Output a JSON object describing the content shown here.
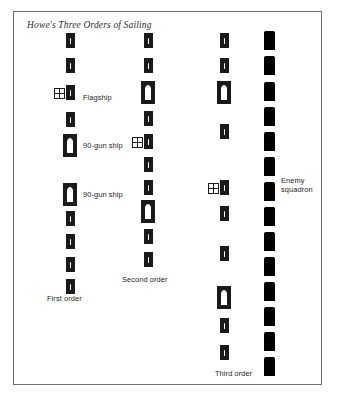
{
  "figure": {
    "title": "Howe's Three Orders of Sailing",
    "frame_color": "#6e6e6e",
    "ink_color": "#1a1a1a",
    "enemy_fill": "#000000"
  },
  "labels": {
    "flagship": "Flagship",
    "gun_ship_upper": "90-gun ship",
    "gun_ship_lower": "90-gun ship",
    "enemy_squadron": "Enemy squadron",
    "first_order": "First order",
    "second_order": "Second order",
    "third_order": "Third order"
  },
  "columns": [
    {
      "name": "first-order",
      "label": "First order",
      "label_x": 47,
      "label_y": 294,
      "center_x": 70,
      "ships": [
        {
          "kind": "small",
          "y": 33
        },
        {
          "kind": "small",
          "y": 58
        },
        {
          "kind": "small",
          "y": 85,
          "flagship": true
        },
        {
          "kind": "small",
          "y": 112
        },
        {
          "kind": "large",
          "y": 134
        },
        {
          "kind": "large",
          "y": 183
        },
        {
          "kind": "small",
          "y": 211
        },
        {
          "kind": "small",
          "y": 234
        },
        {
          "kind": "small",
          "y": 257
        },
        {
          "kind": "small",
          "y": 279
        }
      ]
    },
    {
      "name": "second-order",
      "label": "Second order",
      "label_x": 122,
      "label_y": 275,
      "center_x": 148,
      "ships": [
        {
          "kind": "small",
          "y": 33
        },
        {
          "kind": "small",
          "y": 58
        },
        {
          "kind": "large",
          "y": 81
        },
        {
          "kind": "small",
          "y": 111
        },
        {
          "kind": "small",
          "y": 134,
          "flagship": true
        },
        {
          "kind": "small",
          "y": 157
        },
        {
          "kind": "small",
          "y": 180
        },
        {
          "kind": "large",
          "y": 200
        },
        {
          "kind": "small",
          "y": 229
        },
        {
          "kind": "small",
          "y": 252
        }
      ]
    },
    {
      "name": "third-order",
      "label": "Third order",
      "label_x": 215,
      "label_y": 369,
      "center_x": 224,
      "ships": [
        {
          "kind": "small",
          "y": 33
        },
        {
          "kind": "small",
          "y": 58
        },
        {
          "kind": "large",
          "y": 81
        },
        {
          "kind": "small",
          "y": 124
        },
        {
          "kind": "small",
          "y": 180,
          "flagship": true
        },
        {
          "kind": "small",
          "y": 206
        },
        {
          "kind": "small",
          "y": 246
        },
        {
          "kind": "large",
          "y": 286
        },
        {
          "kind": "small",
          "y": 318
        },
        {
          "kind": "small",
          "y": 345
        }
      ]
    }
  ],
  "enemy": {
    "name": "enemy-squadron",
    "label": "Enemy squadron",
    "label_x": 281,
    "label_y": 176,
    "center_x": 269,
    "ships": [
      {
        "kind": "enemy",
        "y": 31
      },
      {
        "kind": "enemy",
        "y": 56
      },
      {
        "kind": "enemy",
        "y": 82
      },
      {
        "kind": "enemy",
        "y": 107
      },
      {
        "kind": "enemy",
        "y": 132
      },
      {
        "kind": "enemy",
        "y": 157
      },
      {
        "kind": "enemy",
        "y": 182
      },
      {
        "kind": "enemy",
        "y": 207
      },
      {
        "kind": "enemy",
        "y": 232
      },
      {
        "kind": "enemy",
        "y": 257
      },
      {
        "kind": "enemy",
        "y": 282
      },
      {
        "kind": "enemy",
        "y": 307
      },
      {
        "kind": "enemy",
        "y": 332
      },
      {
        "kind": "enemy",
        "y": 357
      }
    ]
  },
  "annotations": [
    {
      "name": "flagship-label",
      "text": "Flagship",
      "x": 83,
      "y": 93,
      "wrap": false
    },
    {
      "name": "gun-ship-upper-label",
      "text": "90-gun ship",
      "x": 83,
      "y": 141,
      "wrap": false
    },
    {
      "name": "gun-ship-lower-label",
      "text": "90-gun ship",
      "x": 83,
      "y": 190,
      "wrap": false
    },
    {
      "name": "enemy-squadron-label",
      "text": "Enemy squadron",
      "x": 281,
      "y": 176,
      "wrap": true
    },
    {
      "name": "first-order-label",
      "text": "First order",
      "x": 47,
      "y": 294,
      "wrap": false
    },
    {
      "name": "second-order-label",
      "text": "Second order",
      "x": 122,
      "y": 275,
      "wrap": false
    },
    {
      "name": "third-order-label",
      "text": "Third order",
      "x": 215,
      "y": 369,
      "wrap": false
    }
  ]
}
